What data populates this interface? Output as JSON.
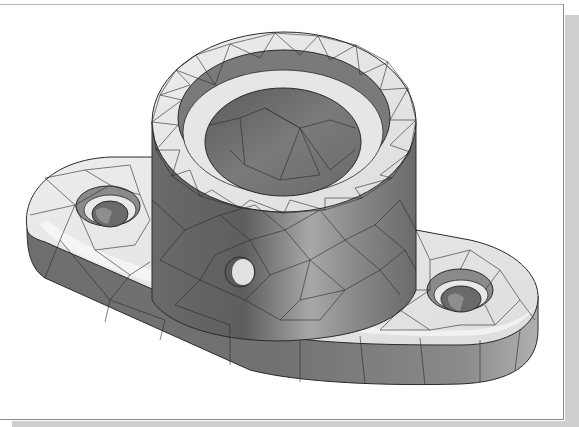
{
  "figure": {
    "colors": {
      "background": "#ffffff",
      "frame_border": "#8a8a8a",
      "frame_shadow": "#cfcfcf",
      "mesh_line": "#2a2a2a",
      "light_face": "#e6e6e6",
      "mid_face": "#9a9a9a",
      "dark_face": "#6e6e6e"
    },
    "features": {
      "boss": {
        "label": "cylindrical-boss"
      },
      "bore": {
        "label": "counterbored-bore"
      },
      "base": {
        "label": "oval-flange-base"
      },
      "left_hole": {
        "label": "left-mounting-hole"
      },
      "right_hole": {
        "label": "right-mounting-hole"
      },
      "side_hole": {
        "label": "radial-side-hole"
      }
    }
  }
}
